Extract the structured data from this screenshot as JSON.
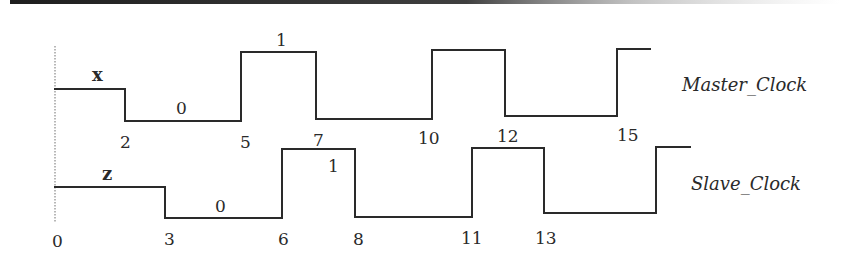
{
  "diagram": {
    "type": "timing-diagram",
    "signals": [
      {
        "name": "Master_Clock",
        "initial_value": "x",
        "value_labels": [
          "0",
          "1"
        ],
        "transition_times": [
          "2",
          "5",
          "7",
          "10",
          "12",
          "15"
        ],
        "segments": [
          {
            "from": 0,
            "to": 2,
            "level": "x"
          },
          {
            "from": 2,
            "to": 5,
            "level": "0"
          },
          {
            "from": 5,
            "to": 7,
            "level": "1"
          },
          {
            "from": 7,
            "to": 10,
            "level": "0"
          },
          {
            "from": 10,
            "to": 12,
            "level": "1"
          },
          {
            "from": 12,
            "to": 15,
            "level": "0"
          },
          {
            "from": 15,
            "to": null,
            "level": "1"
          }
        ]
      },
      {
        "name": "Slave_Clock",
        "initial_value": "z",
        "value_labels": [
          "0",
          "1"
        ],
        "transition_times": [
          "0",
          "3",
          "6",
          "8",
          "11",
          "13"
        ],
        "segments": [
          {
            "from": 0,
            "to": 3,
            "level": "z"
          },
          {
            "from": 3,
            "to": 6,
            "level": "0"
          },
          {
            "from": 6,
            "to": 8,
            "level": "1"
          },
          {
            "from": 8,
            "to": 11,
            "level": "0"
          },
          {
            "from": 11,
            "to": 13,
            "level": "1"
          },
          {
            "from": 13,
            "to": 16,
            "level": "0"
          },
          {
            "from": 16,
            "to": null,
            "level": "1"
          }
        ]
      }
    ]
  },
  "labels": {
    "master_name": "Master_Clock",
    "slave_name": "Slave_Clock",
    "master_init": "x",
    "slave_init": "z",
    "master_zero": "0",
    "master_one": "1",
    "slave_zero": "0",
    "slave_one": "1",
    "master_ticks": [
      "2",
      "5",
      "7",
      "10",
      "12",
      "15"
    ],
    "slave_ticks": [
      "0",
      "3",
      "6",
      "8",
      "11",
      "13"
    ]
  }
}
